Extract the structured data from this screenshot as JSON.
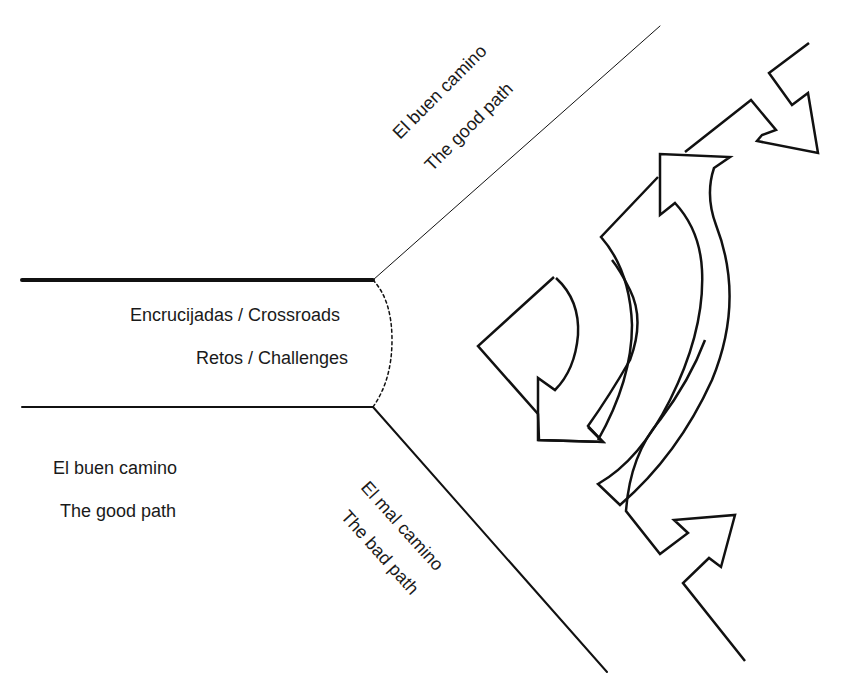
{
  "diagram": {
    "center": {
      "line1": "Encrucijadas / Crossroads",
      "line2": "Retos  / Challenges"
    },
    "left_path": {
      "line1": "El buen camino",
      "line2": "The good path"
    },
    "upper_path": {
      "line1": "El buen camino",
      "line2": "The good path"
    },
    "lower_path": {
      "line1": "El mal camino",
      "line2": "The bad path"
    },
    "colors": {
      "stroke": "#111111",
      "text": "#1a1a1a",
      "background": "#ffffff"
    }
  }
}
